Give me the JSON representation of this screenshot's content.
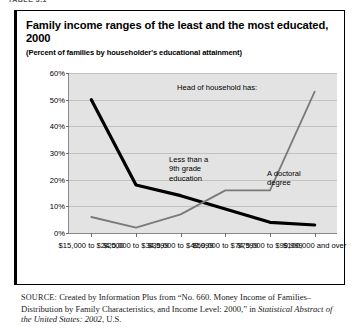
{
  "clipped_header": "TABLE 3.1",
  "figure": {
    "title": "Family income ranges of the least and the most educated, 2000",
    "subtitle": "(Percent of families by householder's educational attainment)"
  },
  "source": {
    "label": "SOURCE:",
    "text_1": " Created by Information Plus from “No. 660. Money Income of Families–Distribution by Family Characteristics, and Income Level: 2000,” in ",
    "italic_1": "Statistical Abstract of the United States: 2002",
    "text_2": ", U.S."
  },
  "chart_data": {
    "type": "line",
    "title": "Family income ranges of the least and the most educated, 2000",
    "subtitle": "(Percent of families by householder's educational attainment)",
    "xlabel": "",
    "ylabel": "",
    "ylim": [
      0,
      60
    ],
    "yticks": [
      "0%",
      "10%",
      "20%",
      "30%",
      "40%",
      "50%",
      "60%"
    ],
    "ytick_values": [
      0,
      10,
      20,
      30,
      40,
      50,
      60
    ],
    "grid": true,
    "legend": "annotations",
    "categories": [
      "$15,000\nto\n$24,000",
      "$25,000\nto\n$34,999",
      "$35,000\nto\n$49,999",
      "$50,000\nto\n$74,999",
      "$75,000\nto\n$99,999",
      "$100,000\nand\nover"
    ],
    "series": [
      {
        "name": "Less than a 9th grade education",
        "color": "#000000",
        "values": [
          50,
          18,
          14,
          9,
          4,
          3
        ]
      },
      {
        "name": "A doctoral degree",
        "color": "#7a7a7a",
        "values": [
          6,
          2,
          7,
          16,
          16,
          53
        ]
      }
    ],
    "annotations": [
      {
        "id": "head-of-household",
        "text": "Head of household has:"
      },
      {
        "id": "less-than-9th",
        "text": "Less than a\n9th grade\neducation"
      },
      {
        "id": "doctoral-degree",
        "text": "A doctoral\ndegree"
      }
    ]
  },
  "colors": {
    "plot_background": "#e3e3e3",
    "gridline": "#c2c2c2",
    "axis": "#8a8a8a",
    "series_dark": "#000000",
    "series_gray": "#7a7a7a",
    "frame": "#000000"
  }
}
